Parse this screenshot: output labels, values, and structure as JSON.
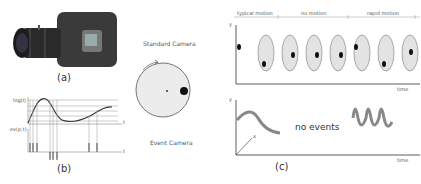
{
  "figure": {
    "panels": {
      "a": {
        "caption": "(a)",
        "content": "camera-with-lens-photo"
      },
      "b": {
        "caption": "(b)",
        "upper_plot": {
          "ylabel": "log(I)",
          "xlabel": "t"
        },
        "lower_plot": {
          "ylabel": "ev(p,t)",
          "xlabel": "t"
        }
      },
      "c": {
        "caption": "(c)",
        "standard_camera_label": "Standard Camera",
        "event_camera_label": "Event Camera",
        "segments": [
          "typical motion",
          "no motion",
          "rapid motion"
        ],
        "top_plot": {
          "ylabel": "y",
          "xlabel": "time",
          "frame_count": 8
        },
        "bottom_plot": {
          "ylabel": "y",
          "xaxis2": "x",
          "xlabel": "time",
          "middle_text": "no events"
        }
      }
    }
  }
}
